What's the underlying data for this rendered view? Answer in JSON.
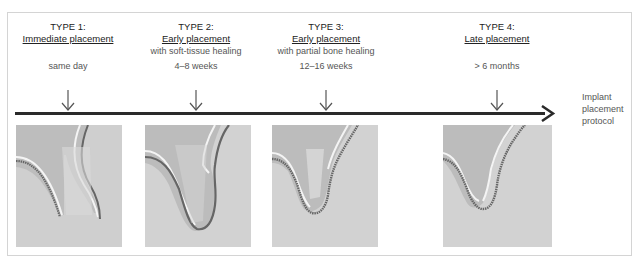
{
  "diagram": {
    "axis_label_lines": [
      "Implant",
      "placement",
      "protocol"
    ],
    "stages": [
      {
        "type": "TYPE 1:",
        "name": "Immediate placement",
        "sub": "",
        "time": "same day",
        "arrow_x": 68
      },
      {
        "type": "TYPE 2:",
        "name": "Early placement",
        "sub": "with soft-tissue healing",
        "time": "4–8 weeks",
        "arrow_x": 196
      },
      {
        "type": "TYPE 3:",
        "name": "Early placement",
        "sub": "with partial bone healing",
        "time": "12–16 weeks",
        "arrow_x": 326
      },
      {
        "type": "TYPE 4:",
        "name": "Late placement",
        "sub": "",
        "time": "> 6 months",
        "arrow_x": 497
      }
    ],
    "colors": {
      "timeline": "#2a2a2a",
      "bone": "#d2d2d2",
      "soft_tissue": "#b8b8b8",
      "gum_line": "#6a6a6a",
      "highlight": "#f2f2f2"
    }
  }
}
